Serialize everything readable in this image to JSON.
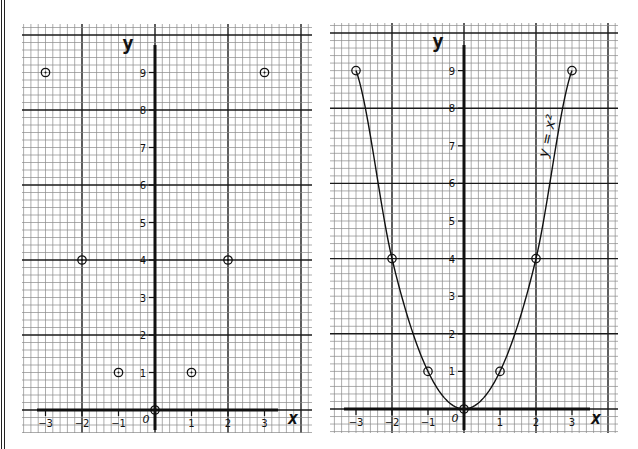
{
  "chart_data": [
    {
      "type": "scatter",
      "title": "",
      "xlabel": "x",
      "ylabel": "y",
      "x": [
        -3,
        -2,
        -1,
        0,
        1,
        2,
        3
      ],
      "y": [
        9,
        4,
        1,
        0,
        1,
        4,
        9
      ],
      "marker": "circle-dot",
      "x_ticks": [
        "-3",
        "-2",
        "-1",
        "0",
        "1",
        "2",
        "3"
      ],
      "y_ticks": [
        "1",
        "2",
        "3",
        "4",
        "5",
        "6",
        "7",
        "8",
        "9"
      ],
      "xlim": [
        -3.6,
        4.3
      ],
      "ylim": [
        -0.6,
        10.3
      ],
      "grid": true,
      "grid_minor_per_unit": 5,
      "grid_major_every_units": 2
    },
    {
      "type": "line",
      "title": "",
      "xlabel": "x",
      "ylabel": "y",
      "series": [
        {
          "name": "y = x²",
          "x": [
            -3,
            -2,
            -1,
            0,
            1,
            2,
            3
          ],
          "y": [
            9,
            4,
            1,
            0,
            1,
            4,
            9
          ]
        }
      ],
      "marker": "circle",
      "curve_label": "y = x²",
      "x_ticks": [
        "-3",
        "-2",
        "-1",
        "0",
        "1",
        "2",
        "3"
      ],
      "y_ticks": [
        "1",
        "2",
        "3",
        "4",
        "5",
        "6",
        "7",
        "8",
        "9"
      ],
      "xlim": [
        -3.7,
        4.3
      ],
      "ylim": [
        -0.6,
        10.3
      ],
      "grid": true,
      "grid_minor_per_unit": 5,
      "grid_major_every_units": 2
    }
  ],
  "panels": {
    "left": {
      "x_label": "x",
      "y_label": "y",
      "origin_label": "0"
    },
    "right": {
      "x_label": "x",
      "y_label": "y",
      "origin_label": "0",
      "curve_label": "y = x²"
    }
  },
  "colors": {
    "ink": "#111111",
    "grid_minor": "#8a8a8a",
    "grid_major": "#1a1a1a",
    "paper": "#ffffff"
  }
}
